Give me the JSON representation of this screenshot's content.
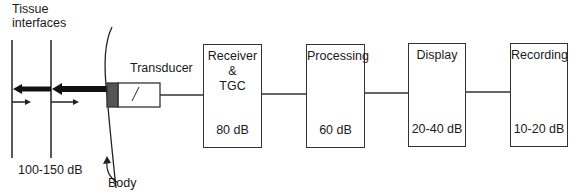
{
  "labels": {
    "tissue_interfaces_line1": "Tissue",
    "tissue_interfaces_line2": "interfaces",
    "transducer": "Transducer",
    "tissue_range": "100-150 dB",
    "body": "Body"
  },
  "blocks": [
    {
      "title_lines": [
        "Receiver",
        "&",
        "TGC"
      ],
      "range": "80 dB"
    },
    {
      "title_lines": [
        "Processing"
      ],
      "range": "60 dB"
    },
    {
      "title_lines": [
        "Display"
      ],
      "range": "20-40 dB"
    },
    {
      "title_lines": [
        "Recording"
      ],
      "range": "10-20 dB"
    }
  ],
  "colors": {
    "line": "#222222",
    "transducer_face": "#555555"
  }
}
